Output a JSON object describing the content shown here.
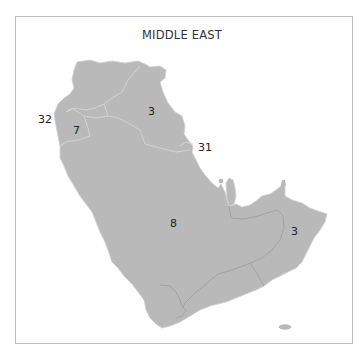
{
  "map": {
    "title": "MIDDLE EAST",
    "land_color": "#b9b9b9",
    "border_color": "#d9d9d9",
    "internal_border_color": "#a0a0a0",
    "frame_color": "#bdbdbd",
    "labels": [
      {
        "id": "north-east-region",
        "value": "3"
      },
      {
        "id": "west-coast-outside",
        "value": "32"
      },
      {
        "id": "north-west-region",
        "value": "7"
      },
      {
        "id": "gulf-coast-outside",
        "value": "31"
      },
      {
        "id": "central-peninsula",
        "value": "8"
      },
      {
        "id": "south-east-region",
        "value": "3"
      }
    ]
  }
}
